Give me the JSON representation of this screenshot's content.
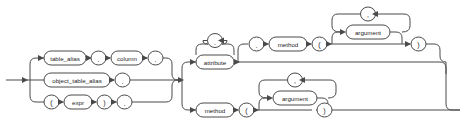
{
  "diagram": {
    "kind": "railroad-syntax-diagram",
    "name": "object_access_expression",
    "width": 466,
    "height": 126,
    "background_color": "#ffffff",
    "line_color": "#4a4a4a",
    "text_color": "#1d1d1d",
    "node_fill": "#ffffff"
  },
  "nodes": {
    "table_alias": "table_alias",
    "object_table_alias": "object_table_alias",
    "expr": "expr",
    "column": "column",
    "attribute": "attribute",
    "method_top": "method",
    "method_bottom": "method",
    "argument_top": "argument",
    "argument_bottom": "argument",
    "dot_1": ".",
    "dot_2": ".",
    "dot_3": ".",
    "dot_4": ".",
    "dot_attr_loop": ".",
    "dot_before_method": ".",
    "lparen_expr": "(",
    "rparen_expr": ")",
    "lparen_top": "(",
    "rparen_top": ")",
    "lparen_bottom": "(",
    "rparen_bottom": ")",
    "comma_top": ",",
    "comma_bottom": ","
  },
  "branches": {
    "left_alternatives": [
      [
        "table_alias",
        ".",
        "column",
        "."
      ],
      [
        "object_table_alias",
        "."
      ],
      [
        "(",
        "expr",
        ")",
        "."
      ]
    ],
    "right_alternatives": [
      [
        "attribute (repeat separated by .)",
        ".",
        "method",
        "(",
        "argument (repeat separated by ,)",
        ")"
      ],
      [
        "method",
        "(",
        "argument (repeat separated by ,)",
        ")"
      ]
    ]
  }
}
